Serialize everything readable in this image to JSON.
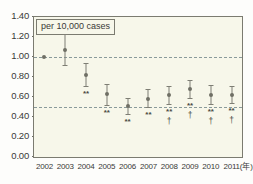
{
  "chart_data": {
    "type": "scatter",
    "title": "per 10,000 cases",
    "xlabel": "",
    "ylabel": "",
    "x_unit_label": "(年)",
    "ylim": [
      0.0,
      1.4
    ],
    "y_ticks": [
      "0.00",
      "0.20",
      "0.40",
      "0.60",
      "0.80",
      "1.00",
      "1.20",
      "1.40"
    ],
    "y_tick_values": [
      0.0,
      0.2,
      0.4,
      0.6,
      0.8,
      1.0,
      1.2,
      1.4
    ],
    "categories": [
      "2002",
      "2003",
      "2004",
      "2005",
      "2006",
      "2007",
      "2008",
      "2009",
      "2010",
      "2011"
    ],
    "grid": false,
    "legend": "none",
    "reference_lines": [
      {
        "value": 1.0,
        "style": "dashed"
      },
      {
        "value": 0.5,
        "style": "dashed"
      }
    ],
    "points": [
      {
        "x": "2002",
        "value": 1.0,
        "low": 1.0,
        "high": 1.0,
        "significance": ""
      },
      {
        "x": "2003",
        "value": 1.07,
        "low": 0.92,
        "high": 1.23,
        "significance": ""
      },
      {
        "x": "2004",
        "value": 0.82,
        "low": 0.71,
        "high": 0.94,
        "significance": "**"
      },
      {
        "x": "2005",
        "value": 0.63,
        "low": 0.52,
        "high": 0.73,
        "significance": "**"
      },
      {
        "x": "2006",
        "value": 0.51,
        "low": 0.43,
        "high": 0.59,
        "significance": "**"
      },
      {
        "x": "2007",
        "value": 0.58,
        "low": 0.5,
        "high": 0.68,
        "significance": "**"
      },
      {
        "x": "2008",
        "value": 0.62,
        "low": 0.53,
        "high": 0.71,
        "significance": "**",
        "significance2": "†"
      },
      {
        "x": "2009",
        "value": 0.68,
        "low": 0.59,
        "high": 0.77,
        "significance": "**",
        "significance2": "†"
      },
      {
        "x": "2010",
        "value": 0.62,
        "low": 0.53,
        "high": 0.72,
        "significance": "**",
        "significance2": "†"
      },
      {
        "x": "2011",
        "value": 0.62,
        "low": 0.54,
        "high": 0.71,
        "significance": "**",
        "significance2": "†"
      }
    ],
    "colors": {
      "plot_background": "#f7f7ea",
      "axis": "#7b7b70",
      "marker": "#6f6f65",
      "error_bar": "#7e7e74",
      "reference_line": "#8a9a9a",
      "text": "#3a3a38"
    }
  }
}
